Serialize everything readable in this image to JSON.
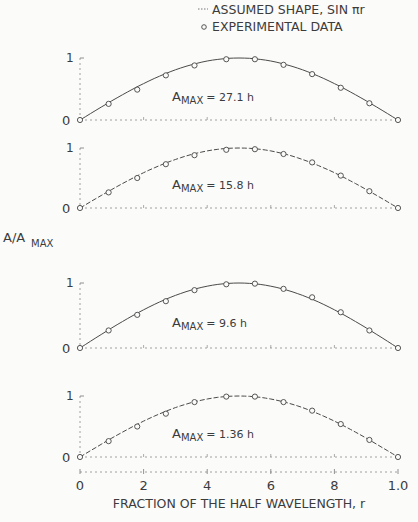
{
  "chart_data": {
    "type": "line",
    "title": "",
    "xlabel": "FRACTION OF THE HALF WAVELENGTH, r",
    "ylabel": "A/A_MAX",
    "ylabel_main": "A/A",
    "ylabel_sub": "MAX",
    "xlim": [
      0,
      1.0
    ],
    "ylim": [
      0,
      1
    ],
    "x_tick_labels": [
      "0",
      ".2",
      ".4",
      ".6",
      ".8",
      "1.0"
    ],
    "x_tick_labels_display": [
      "0",
      "2",
      "4",
      "6",
      "8",
      "1.0"
    ],
    "y_tick_labels": [
      "0",
      "1"
    ],
    "grid": false,
    "legend": {
      "position": "top-right",
      "entries": [
        {
          "marker": "line",
          "label": "ASSUMED SHAPE, SIN πr"
        },
        {
          "marker": "open-circle",
          "label": "EXPERIMENTAL DATA"
        }
      ]
    },
    "x": [
      0,
      0.083,
      0.167,
      0.25,
      0.333,
      0.417,
      0.5,
      0.583,
      0.667,
      0.75,
      0.833,
      0.917,
      1.0
    ],
    "panels": [
      {
        "annotation_main": "A",
        "annotation_sub": "MAX",
        "annotation_value": "= 27.1 h",
        "amax": "27.1 h",
        "series": [
          {
            "name": "ASSUMED SHAPE, SIN πr",
            "values": [
              0,
              0.26,
              0.5,
              0.71,
              0.87,
              0.97,
              1.0,
              0.97,
              0.87,
              0.71,
              0.5,
              0.26,
              0
            ]
          },
          {
            "name": "EXPERIMENTAL DATA",
            "x": [
              0,
              0.09,
              0.18,
              0.27,
              0.36,
              0.46,
              0.55,
              0.64,
              0.73,
              0.82,
              0.91,
              1.0
            ],
            "values": [
              0,
              0.26,
              0.49,
              0.72,
              0.88,
              0.98,
              0.98,
              0.89,
              0.74,
              0.52,
              0.27,
              0
            ]
          }
        ]
      },
      {
        "annotation_main": "A",
        "annotation_sub": "MAX",
        "annotation_value": "= 15.8 h",
        "amax": "15.8 h",
        "series": [
          {
            "name": "ASSUMED SHAPE, SIN πr",
            "values": [
              0,
              0.26,
              0.5,
              0.71,
              0.87,
              0.97,
              1.0,
              0.97,
              0.87,
              0.71,
              0.5,
              0.26,
              0
            ]
          },
          {
            "name": "EXPERIMENTAL DATA",
            "x": [
              0,
              0.09,
              0.18,
              0.27,
              0.36,
              0.46,
              0.55,
              0.64,
              0.73,
              0.82,
              0.91,
              1.0
            ],
            "values": [
              0,
              0.26,
              0.5,
              0.73,
              0.88,
              0.97,
              0.98,
              0.9,
              0.76,
              0.54,
              0.28,
              0
            ]
          }
        ]
      },
      {
        "annotation_main": "A",
        "annotation_sub": "MAX",
        "annotation_value": "= 9.6 h",
        "amax": "9.6 h",
        "series": [
          {
            "name": "ASSUMED SHAPE, SIN πr",
            "values": [
              0,
              0.26,
              0.5,
              0.71,
              0.87,
              0.97,
              1.0,
              0.97,
              0.87,
              0.71,
              0.5,
              0.26,
              0
            ]
          },
          {
            "name": "EXPERIMENTAL DATA",
            "x": [
              0,
              0.09,
              0.18,
              0.27,
              0.36,
              0.46,
              0.55,
              0.64,
              0.73,
              0.82,
              0.91,
              1.0
            ],
            "values": [
              0,
              0.27,
              0.51,
              0.72,
              0.89,
              0.98,
              0.99,
              0.91,
              0.78,
              0.55,
              0.27,
              0
            ]
          }
        ]
      },
      {
        "annotation_main": "A",
        "annotation_sub": "MAX",
        "annotation_value": "= 1.36 h",
        "amax": "1.36 h",
        "series": [
          {
            "name": "ASSUMED SHAPE, SIN πr",
            "values": [
              0,
              0.26,
              0.5,
              0.71,
              0.87,
              0.97,
              1.0,
              0.97,
              0.87,
              0.71,
              0.5,
              0.26,
              0
            ]
          },
          {
            "name": "EXPERIMENTAL DATA",
            "x": [
              0,
              0.09,
              0.18,
              0.27,
              0.36,
              0.46,
              0.55,
              0.64,
              0.73,
              0.82,
              0.91,
              1.0
            ],
            "values": [
              0,
              0.26,
              0.5,
              0.71,
              0.9,
              0.99,
              0.99,
              0.9,
              0.76,
              0.54,
              0.28,
              0
            ]
          }
        ]
      }
    ]
  }
}
